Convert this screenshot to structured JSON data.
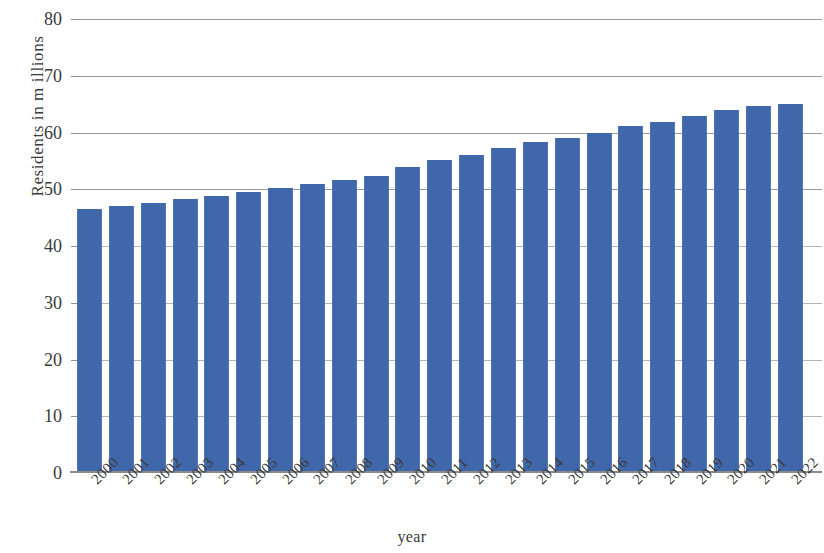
{
  "chart_data": {
    "type": "bar",
    "title": "",
    "subtitle": "",
    "xlabel": "year",
    "ylabel": "Residents in m illions",
    "categories": [
      "2000",
      "2001",
      "2002",
      "2003",
      "2004",
      "2005",
      "2006",
      "2007",
      "2008",
      "2009",
      "2010",
      "2011",
      "2012",
      "2013",
      "2014",
      "2015",
      "2016",
      "2017",
      "2018",
      "2019",
      "2020",
      "2021",
      "2022"
    ],
    "values": [
      46.6,
      47.0,
      47.5,
      48.2,
      48.9,
      49.5,
      50.3,
      51.0,
      51.6,
      52.3,
      53.9,
      55.2,
      56.1,
      57.2,
      58.4,
      59.1,
      60.0,
      61.1,
      61.9,
      62.9,
      63.9,
      64.6,
      65.1
    ],
    "series": [
      {
        "name": "Residents",
        "values": [
          46.6,
          47.0,
          47.5,
          48.2,
          48.9,
          49.5,
          50.3,
          51.0,
          51.6,
          52.3,
          53.9,
          55.2,
          56.1,
          57.2,
          58.4,
          59.1,
          60.0,
          61.1,
          61.9,
          62.9,
          63.9,
          64.6,
          65.1
        ]
      }
    ],
    "ylim": [
      0,
      80
    ],
    "y_ticks": [
      0,
      10,
      20,
      30,
      40,
      50,
      60,
      70,
      80
    ],
    "y_tick_labels": [
      "0",
      "10",
      "20",
      "30",
      "40",
      "50",
      "60",
      "70",
      "80"
    ],
    "grid": true,
    "grid_axis": "y",
    "legend": false,
    "legend_position": "none",
    "bar_color": "#4167ab",
    "grid_color": "#9a9a9a",
    "axis_color": "#8b8b8b",
    "text_color": "#3a3a3a",
    "background_color": "#ffffff",
    "x_tick_rotation": -45
  }
}
